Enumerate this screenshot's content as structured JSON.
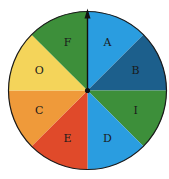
{
  "spinner": {
    "title": "",
    "center": {
      "x": 87.5,
      "y": 90.5
    },
    "radius": 79,
    "border_color": "#1a1a1a",
    "pointer": {
      "direction": "up",
      "color": "#111111"
    },
    "sectors": [
      {
        "label": "A",
        "color": "#2a9de0",
        "start_deg": 0,
        "end_deg": 45
      },
      {
        "label": "B",
        "color": "#1c5f8c",
        "start_deg": 45,
        "end_deg": 90
      },
      {
        "label": "I",
        "color": "#3d8f3a",
        "start_deg": 90,
        "end_deg": 135
      },
      {
        "label": "D",
        "color": "#2a9de0",
        "start_deg": 135,
        "end_deg": 180
      },
      {
        "label": "E",
        "color": "#e04a2a",
        "start_deg": 180,
        "end_deg": 225
      },
      {
        "label": "C",
        "color": "#ef9a3a",
        "start_deg": 225,
        "end_deg": 270
      },
      {
        "label": "O",
        "color": "#f4d45a",
        "start_deg": 270,
        "end_deg": 315
      },
      {
        "label": "F",
        "color": "#3d8f3a",
        "start_deg": 315,
        "end_deg": 360
      }
    ]
  }
}
